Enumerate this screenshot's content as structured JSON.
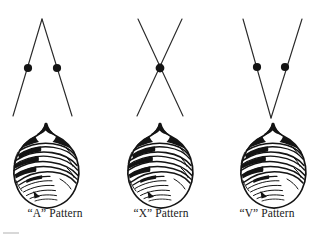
{
  "figure": {
    "background_color": "#ffffff",
    "ink_color": "#1a1a1a",
    "panels": [
      {
        "id": "a-pattern",
        "label": "“A” Pattern",
        "letter": "A",
        "quote_style": "double-curly",
        "diagram_type": "inverted-v",
        "description": "Two straight lines meeting at an apex above, diverging downward",
        "apex": {
          "x": 42,
          "y": 19
        },
        "lines": [
          {
            "name": "left-stroke",
            "x1": 42,
            "y1": 19,
            "x2": 13,
            "y2": 116
          },
          {
            "name": "right-stroke",
            "x1": 42,
            "y1": 19,
            "x2": 72,
            "y2": 116
          }
        ],
        "dots": [
          {
            "name": "left-dot",
            "cx": 28,
            "cy": 68,
            "r": 4.1
          },
          {
            "name": "right-dot",
            "cx": 57,
            "cy": 68,
            "r": 4.1
          }
        ],
        "dot_count": 2,
        "specimen": {
          "cx": 46,
          "cy": 166,
          "width": 66,
          "height": 86
        }
      },
      {
        "id": "x-pattern",
        "label": "“X” Pattern",
        "letter": "X",
        "quote_style": "double-curly",
        "diagram_type": "crossing-x",
        "description": "Two straight lines crossing at a midpoint",
        "crossing_point": {
          "x": 160,
          "y": 68
        },
        "lines": [
          {
            "name": "left-to-right-stroke",
            "x1": 138,
            "y1": 19,
            "x2": 183,
            "y2": 116
          },
          {
            "name": "right-to-left-stroke",
            "x1": 182,
            "y1": 19,
            "x2": 137,
            "y2": 116
          }
        ],
        "dots": [
          {
            "name": "center-dot",
            "cx": 160,
            "cy": 68,
            "r": 4.4
          }
        ],
        "dot_count": 1,
        "specimen": {
          "cx": 160,
          "cy": 166,
          "width": 66,
          "height": 86
        }
      },
      {
        "id": "v-pattern",
        "label": "“V” Pattern",
        "letter": "V",
        "quote_style": "double-curly",
        "diagram_type": "v",
        "description": "Two straight lines converging at a vertex below",
        "vertex": {
          "x": 271,
          "y": 118
        },
        "lines": [
          {
            "name": "left-stroke",
            "x1": 243,
            "y1": 19,
            "x2": 271,
            "y2": 118
          },
          {
            "name": "right-stroke",
            "x1": 302,
            "y1": 19,
            "x2": 271,
            "y2": 118
          }
        ],
        "dots": [
          {
            "name": "left-dot",
            "cx": 257,
            "cy": 67,
            "r": 4.1
          },
          {
            "name": "right-dot",
            "cx": 285,
            "cy": 67,
            "r": 4.1
          }
        ],
        "dot_count": 2,
        "specimen": {
          "cx": 273,
          "cy": 166,
          "width": 66,
          "height": 86
        }
      }
    ],
    "specimen_drawing": {
      "name": "ridged-teat-specimen",
      "description": "Oval specimen with a pointed tip at top and curved ridge striations across the body",
      "repeat_count": 3,
      "identical": true
    },
    "artifact": {
      "name": "scan-edge-artifact",
      "visible": true,
      "color": "#d8d8d8"
    }
  }
}
